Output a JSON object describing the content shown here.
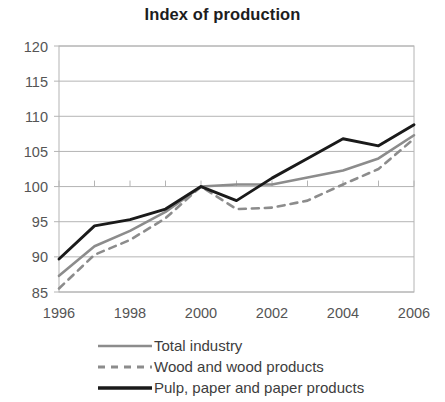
{
  "chart_data": {
    "type": "line",
    "title": "Index of production",
    "xlabel": "",
    "ylabel": "",
    "xlim": [
      1996,
      2006
    ],
    "ylim": [
      85,
      120
    ],
    "grid": true,
    "legend_position": "bottom-left",
    "x": [
      1996,
      1997,
      1998,
      1999,
      2000,
      2001,
      2002,
      2003,
      2004,
      2005,
      2006
    ],
    "xticks": [
      "1996",
      "1998",
      "2000",
      "2002",
      "2004",
      "2006"
    ],
    "xtick_values": [
      1996,
      1998,
      2000,
      2002,
      2004,
      2006
    ],
    "yticks": [
      "85",
      "90",
      "95",
      "100",
      "105",
      "110",
      "115",
      "120"
    ],
    "ytick_values": [
      85,
      90,
      95,
      100,
      105,
      110,
      115,
      120
    ],
    "series": [
      {
        "name": "Total industry",
        "style": "solid",
        "color": "#8c8c8c",
        "width": 2.6,
        "values": [
          87.3,
          91.5,
          93.7,
          96.4,
          100.0,
          100.3,
          100.3,
          101.3,
          102.3,
          104.0,
          107.3
        ]
      },
      {
        "name": "Wood and wood products",
        "style": "dashed",
        "color": "#8c8c8c",
        "width": 2.6,
        "values": [
          85.5,
          90.3,
          92.4,
          95.5,
          100.0,
          96.8,
          97.0,
          98.0,
          100.3,
          102.5,
          106.8
        ]
      },
      {
        "name": "Pulp, paper and paper products",
        "style": "solid",
        "color": "#1a1a1a",
        "width": 2.9,
        "values": [
          89.7,
          94.4,
          95.3,
          96.8,
          100.0,
          98.0,
          101.2,
          104.0,
          106.8,
          105.8,
          108.8
        ]
      }
    ]
  },
  "legend": {
    "items": [
      {
        "label": "Total industry"
      },
      {
        "label": "Wood and wood products"
      },
      {
        "label": "Pulp, paper and paper products"
      }
    ]
  },
  "colors": {
    "gray_series": "#8c8c8c",
    "black_series": "#1a1a1a",
    "grid": "#b4b4b4",
    "axis_text": "#555555",
    "title": "#1d1d1d",
    "background": "#ffffff"
  }
}
